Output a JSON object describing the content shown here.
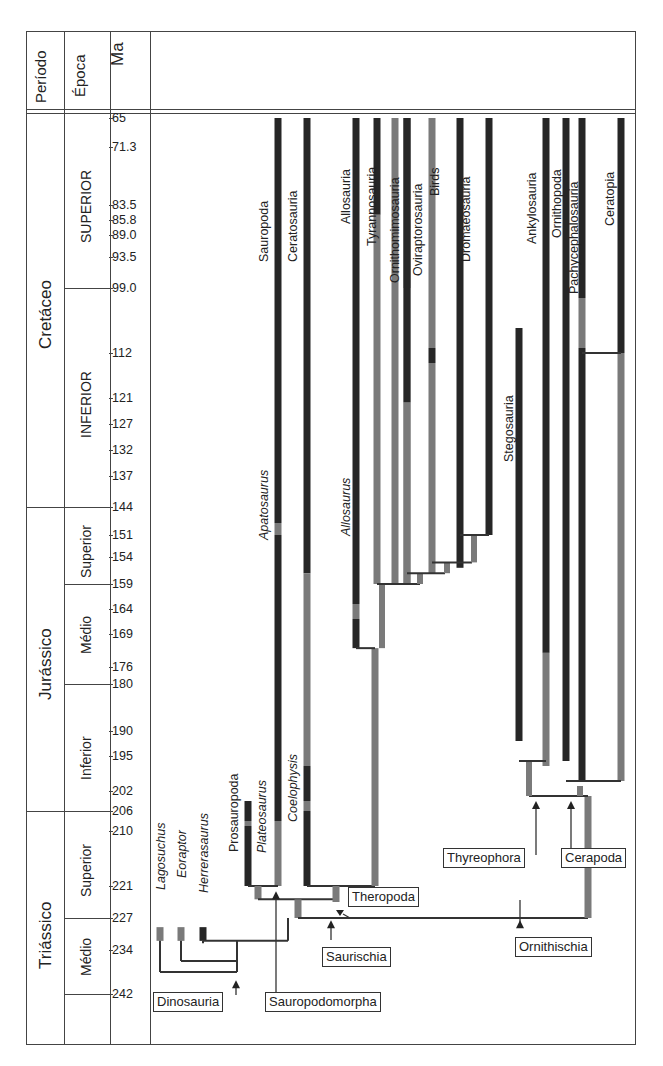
{
  "header": {
    "period_label": "Período",
    "epoch_label": "Época",
    "ma_label": "Ma"
  },
  "periods": [
    {
      "name": "Cretáceo",
      "from": 65,
      "to": 144
    },
    {
      "name": "Jurássico",
      "from": 144,
      "to": 206
    },
    {
      "name": "Triássico",
      "from": 206,
      "to": 245
    }
  ],
  "epochs": [
    {
      "name": "SUPERIOR",
      "from": 65,
      "to": 99.0
    },
    {
      "name": "INFERIOR",
      "from": 99.0,
      "to": 144
    },
    {
      "name": "Superior",
      "from": 144,
      "to": 159
    },
    {
      "name": "Médio",
      "from": 159,
      "to": 180
    },
    {
      "name": "Inferior",
      "from": 180,
      "to": 206
    },
    {
      "name": "Superior",
      "from": 206,
      "to": 227
    },
    {
      "name": "Médio",
      "from": 227,
      "to": 242
    },
    {
      "name": "",
      "from": 242,
      "to": 245
    }
  ],
  "ma_ticks": [
    "65",
    "71.3",
    "83.5",
    "85.8",
    "89.0",
    "93.5",
    "99.0",
    "112",
    "121",
    "127",
    "132",
    "137",
    "144",
    "151",
    "154",
    "159",
    "164",
    "169",
    "176",
    "180",
    "190",
    "195",
    "202",
    "206",
    "210",
    "221",
    "227",
    "234",
    "242"
  ],
  "colors": {
    "known_range": "#262626",
    "inferred_range": "#7a7a7a",
    "line": "#333333"
  },
  "chart_data": {
    "type": "phylogeny",
    "title": "",
    "ylabel": "Ma",
    "ylim": [
      65,
      245
    ],
    "terminal_taxa": [
      {
        "name": "Lagosuchus",
        "italic": true,
        "known": [
          [
            229,
            232
          ]
        ]
      },
      {
        "name": "Eoraptor",
        "italic": true,
        "known": [
          [
            229,
            232
          ]
        ]
      },
      {
        "name": "Herrerasaurus",
        "italic": true,
        "known": [
          [
            229,
            232
          ]
        ]
      },
      {
        "name": "Prosauropoda",
        "italic": false,
        "known": [
          [
            204,
            208
          ],
          [
            209,
            221
          ]
        ]
      },
      {
        "name": "Plateosaurus",
        "italic": true,
        "known": []
      },
      {
        "name": "Sauropoda",
        "italic": false,
        "known": [
          [
            65,
            148
          ],
          [
            151,
            208
          ]
        ]
      },
      {
        "name": "Apatosaurus",
        "italic": true,
        "known": []
      },
      {
        "name": "Coelophysis",
        "italic": true,
        "known": [
          [
            197,
            204
          ],
          [
            206,
            221
          ]
        ]
      },
      {
        "name": "Ceratosauria",
        "italic": false,
        "known": [
          [
            65,
            152
          ]
        ]
      },
      {
        "name": "Allosauria",
        "italic": false,
        "known": [
          [
            65,
            163
          ],
          [
            166,
            172
          ]
        ]
      },
      {
        "name": "Allosaurus",
        "italic": true,
        "known": []
      },
      {
        "name": "Tyrannosauria",
        "italic": false,
        "known": [
          [
            65,
            85
          ]
        ]
      },
      {
        "name": "Ornithomimosauria",
        "italic": false,
        "known": [
          [
            65,
            99
          ],
          [
            100,
            122
          ]
        ]
      },
      {
        "name": "Oviraptorosauria",
        "italic": false,
        "known": [
          [
            111,
            114
          ]
        ]
      },
      {
        "name": "Birds",
        "italic": false,
        "known": [
          [
            65,
            151
          ]
        ]
      },
      {
        "name": "Dromaeosauria",
        "italic": false,
        "known": [
          [
            65,
            136
          ]
        ]
      },
      {
        "name": "Stegosauria",
        "italic": false,
        "known": [
          [
            107,
            175
          ]
        ]
      },
      {
        "name": "Ankylosauria",
        "italic": false,
        "known": [
          [
            65,
            172
          ]
        ]
      },
      {
        "name": "Ornithopoda",
        "italic": false,
        "known": [
          [
            65,
            196
          ]
        ]
      },
      {
        "name": "Pachycephalosauria",
        "italic": false,
        "known": [
          [
            65,
            101
          ],
          [
            111,
            113
          ]
        ]
      },
      {
        "name": "Ceratopia",
        "italic": false,
        "known": [
          [
            65,
            112
          ]
        ]
      }
    ],
    "clade_labels": [
      "Dinosauria",
      "Sauropodomorpha",
      "Saurischia",
      "Theropoda",
      "Ornithischia",
      "Thyreophora",
      "Cerapoda"
    ]
  }
}
